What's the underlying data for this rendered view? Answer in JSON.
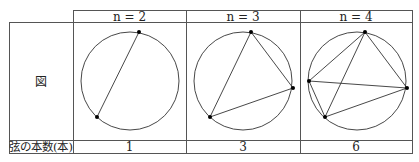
{
  "table": {
    "columns": [
      {
        "header": "n = 2",
        "chords": "1",
        "points": [
          [
            139,
            32
          ],
          [
            97,
            117
          ]
        ],
        "edges": [
          [
            0,
            1
          ]
        ]
      },
      {
        "header": "n = 3",
        "chords": "3",
        "points": [
          [
            251,
            32
          ],
          [
            293,
            88
          ],
          [
            210,
            117
          ]
        ],
        "edges": [
          [
            0,
            1
          ],
          [
            1,
            2
          ],
          [
            2,
            0
          ]
        ]
      },
      {
        "header": "n = 4",
        "chords": "6",
        "points": [
          [
            365,
            32
          ],
          [
            309,
            81
          ],
          [
            407,
            88
          ],
          [
            325,
            117
          ]
        ],
        "edges": [
          [
            0,
            1
          ],
          [
            0,
            2
          ],
          [
            0,
            3
          ],
          [
            1,
            2
          ],
          [
            1,
            3
          ],
          [
            2,
            3
          ]
        ]
      }
    ],
    "row_labels": {
      "figure": "図",
      "chord_count": "弦の本数(本)"
    }
  },
  "colors": {
    "line": "#333333",
    "point": "#000000"
  }
}
